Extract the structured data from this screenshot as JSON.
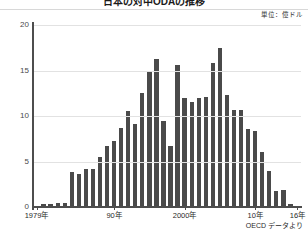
{
  "chart_data": {
    "type": "bar",
    "title": "日本の対中ODAの推移",
    "unit_label": "単位：億ドル",
    "source": "OECD データより",
    "xlabel": "",
    "ylabel": "",
    "ylim": [
      0,
      20
    ],
    "yticks": [
      0,
      5,
      10,
      15,
      20
    ],
    "ytick_labels": [
      "0",
      "5",
      "10",
      "15",
      "20"
    ],
    "grid": true,
    "legend": "none",
    "xtick_labels": [
      "1979年",
      "90年",
      "2000年",
      "10年",
      "16年"
    ],
    "xtick_years": [
      1979,
      1990,
      2000,
      2010,
      2016
    ],
    "categories": [
      "1979",
      "1980",
      "1981",
      "1982",
      "1983",
      "1984",
      "1985",
      "1986",
      "1987",
      "1988",
      "1989",
      "1990",
      "1991",
      "1992",
      "1993",
      "1994",
      "1995",
      "1996",
      "1997",
      "1998",
      "1999",
      "2000",
      "2001",
      "2002",
      "2003",
      "2004",
      "2005",
      "2006",
      "2007",
      "2008",
      "2009",
      "2010",
      "2011",
      "2012",
      "2013",
      "2014",
      "2015",
      "2016"
    ],
    "values": [
      0.0,
      0.3,
      0.3,
      0.4,
      0.4,
      3.9,
      3.6,
      4.2,
      4.2,
      5.5,
      6.7,
      7.2,
      8.7,
      10.5,
      9.1,
      12.5,
      15.0,
      16.3,
      9.4,
      6.7,
      15.6,
      12.0,
      11.5,
      12.0,
      12.1,
      15.8,
      17.5,
      12.3,
      10.7,
      10.7,
      8.6,
      8.3,
      6.1,
      4.0,
      1.8,
      1.9,
      0.3,
      0.1
    ]
  }
}
